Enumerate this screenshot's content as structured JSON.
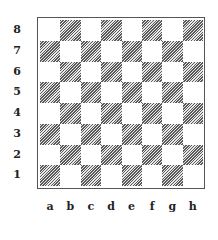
{
  "diagram": {
    "type": "chessboard",
    "ranks": [
      "8",
      "7",
      "6",
      "5",
      "4",
      "3",
      "2",
      "1"
    ],
    "files": [
      "a",
      "b",
      "c",
      "d",
      "e",
      "f",
      "g",
      "h"
    ],
    "bottom_left_square": "a1",
    "bottom_left_color": "dark",
    "colors": {
      "light_square": "#ffffff",
      "dark_square_hatch": "#5a5a5a",
      "frame": "#555555",
      "label": "#222222"
    },
    "pieces": []
  }
}
